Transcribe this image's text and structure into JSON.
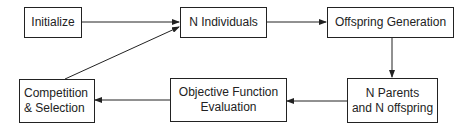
{
  "diagram": {
    "type": "flowchart",
    "nodes": [
      {
        "id": "initialize",
        "label": "Initialize"
      },
      {
        "id": "n-individuals",
        "label": "N Individuals"
      },
      {
        "id": "offspring-generation",
        "label": "Offspring Generation"
      },
      {
        "id": "n-parents-offspring",
        "label_line1": "N Parents",
        "label_line2": "and N offspring"
      },
      {
        "id": "objective-function",
        "label_line1": "Objective Function",
        "label_line2": "Evaluation"
      },
      {
        "id": "competition-selection",
        "label_line1": "Competition",
        "label_line2": "& Selection"
      }
    ],
    "edges": [
      {
        "from": "initialize",
        "to": "n-individuals"
      },
      {
        "from": "n-individuals",
        "to": "offspring-generation"
      },
      {
        "from": "offspring-generation",
        "to": "n-parents-offspring"
      },
      {
        "from": "n-parents-offspring",
        "to": "objective-function"
      },
      {
        "from": "objective-function",
        "to": "competition-selection"
      },
      {
        "from": "competition-selection",
        "to": "n-individuals"
      }
    ],
    "colors": {
      "stroke": "#222222",
      "background": "#ffffff"
    }
  }
}
